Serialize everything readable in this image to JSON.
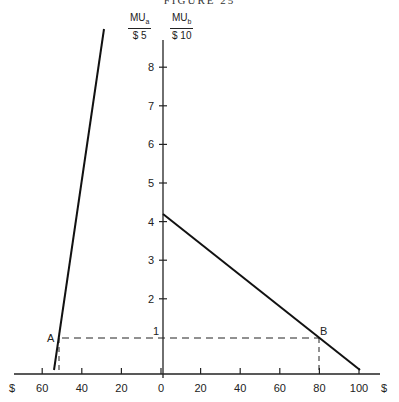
{
  "figure": {
    "title": "FIGURE 25",
    "label_a": {
      "num": "MU",
      "sub": "a",
      "den": "$ 5"
    },
    "label_b": {
      "num": "MU",
      "sub": "b",
      "den": "$ 10"
    },
    "point_a_label": "A",
    "point_b_label": "B",
    "x_currency_left": "$",
    "x_currency_right": "$"
  },
  "chart_data": {
    "type": "line",
    "title": "FIGURE 25",
    "ylabel_left": "MUa / $5",
    "ylabel_right": "MUb / $10",
    "xlabel": "$",
    "x_ticks_left": [
      "60",
      "40",
      "20"
    ],
    "x_ticks_right": [
      "0",
      "20",
      "40",
      "60",
      "80",
      "100"
    ],
    "y_ticks": [
      "1",
      "2",
      "3",
      "4",
      "5",
      "6",
      "7",
      "8"
    ],
    "ylim": [
      0,
      9
    ],
    "grid": false,
    "series": [
      {
        "name": "MUa/$5 (good a, measured leftward)",
        "points": [
          {
            "x": 52,
            "y": 0.1
          },
          {
            "x": 50,
            "y": 1
          },
          {
            "x": 29,
            "y": 9.2
          }
        ]
      },
      {
        "name": "MUb/$10 (good b, measured rightward)",
        "points": [
          {
            "x": 0,
            "y": 4.2
          },
          {
            "x": 80,
            "y": 1
          },
          {
            "x": 100,
            "y": 0.1
          }
        ]
      }
    ],
    "annotations": [
      {
        "label": "A",
        "x": 50,
        "y": 1,
        "side": "left"
      },
      {
        "label": "B",
        "x": 80,
        "y": 1,
        "side": "right"
      }
    ]
  }
}
